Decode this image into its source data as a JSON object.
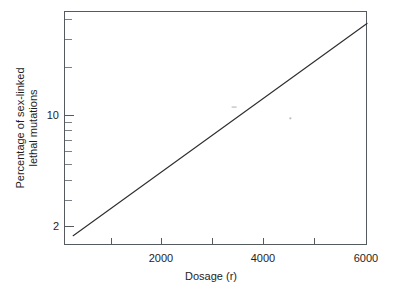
{
  "chart_data": {
    "type": "line",
    "title": "",
    "subtitle": "",
    "xlabel": "Dosage (r)",
    "ylabel": "Percentage of sex-linked lethal mutations",
    "ylabel_line1": "Percentage of sex-linked",
    "ylabel_line2": "lethal mutations",
    "xscale": "linear",
    "yscale": "log",
    "xlim": [
      0,
      6000
    ],
    "ylim": [
      1.5,
      45
    ],
    "grid": false,
    "legend": null,
    "x_ticks": [
      1000,
      2000,
      3000,
      4000,
      5000,
      6000
    ],
    "x_tick_labels": [
      "",
      "2000",
      "",
      "4000",
      "",
      "6000"
    ],
    "y_ticks_labeled": [
      {
        "value": 2,
        "label": "2"
      },
      {
        "value": 10,
        "label": "10"
      }
    ],
    "y_ticks_minor": [
      3,
      4,
      5,
      6,
      7,
      8,
      9,
      20,
      30,
      40
    ],
    "series": [
      {
        "name": "sex-linked lethal mutation rate",
        "x": [
          250,
          6000
        ],
        "y": [
          1.75,
          38.0
        ],
        "color": "#2e2e30",
        "style": "solid"
      }
    ],
    "annotations": [
      {
        "name": "scan-speck",
        "x": 3400,
        "y": 11.4
      },
      {
        "name": "scan-speck",
        "x": 4500,
        "y": 9.6
      }
    ],
    "frame": {
      "left_px": 64,
      "right_px": 367,
      "top_px": 11,
      "bottom_px": 245,
      "border_color": "#555a5e"
    }
  },
  "figure": {
    "background": "#ffffff",
    "axis_color": "#555a5e",
    "line_color": "#2e2e30",
    "text_color": "#1e1e1e"
  }
}
